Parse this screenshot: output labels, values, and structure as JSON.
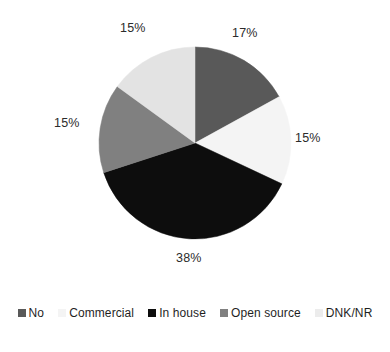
{
  "chart_data": {
    "type": "pie",
    "title": "",
    "subtitle": "",
    "xlabel": "",
    "ylabel": "",
    "grid": false,
    "legend_position": "bottom",
    "start_angle_deg": 0,
    "direction": "clockwise",
    "categories": [
      "No",
      "Commercial",
      "In house",
      "Open source",
      "DNK/NR"
    ],
    "values": [
      17,
      15,
      38,
      15,
      15
    ],
    "value_unit": "%",
    "data_labels": [
      "17%",
      "15%",
      "38%",
      "15%",
      "15%"
    ],
    "colors": [
      "#595959",
      "#f4f4f4",
      "#0d0d0d",
      "#808080",
      "#e3e3e3"
    ],
    "slices": [
      {
        "label": "No",
        "value": 17,
        "display": "17%",
        "color": "#595959"
      },
      {
        "label": "Commercial",
        "value": 15,
        "display": "15%",
        "color": "#f4f4f4"
      },
      {
        "label": "In house",
        "value": 38,
        "display": "38%",
        "color": "#0d0d0d"
      },
      {
        "label": "Open source",
        "value": 15,
        "display": "15%",
        "color": "#808080"
      },
      {
        "label": "DNK/NR",
        "value": 15,
        "display": "15%",
        "color": "#e3e3e3"
      }
    ]
  },
  "legend": {
    "items": [
      {
        "label": "No",
        "color": "#595959"
      },
      {
        "label": "Commercial",
        "color": "#f4f4f4"
      },
      {
        "label": "In house",
        "color": "#0d0d0d"
      },
      {
        "label": "Open source",
        "color": "#808080"
      },
      {
        "label": "DNK/NR",
        "color": "#ececec"
      }
    ]
  }
}
